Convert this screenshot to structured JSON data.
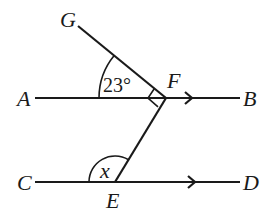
{
  "diagram": {
    "type": "geometry-parallel-lines-angles",
    "points": {
      "G": {
        "label": "G"
      },
      "A": {
        "label": "A"
      },
      "B": {
        "label": "B"
      },
      "F": {
        "label": "F"
      },
      "C": {
        "label": "C"
      },
      "D": {
        "label": "D"
      },
      "E": {
        "label": "E"
      }
    },
    "angles": {
      "GFA": {
        "label": "23°"
      },
      "CEF": {
        "label": "x"
      },
      "GFE": {
        "marker": "right-angle"
      }
    },
    "parallel_lines": [
      "AB",
      "CD"
    ],
    "stroke_color": "#1a1a1a"
  }
}
